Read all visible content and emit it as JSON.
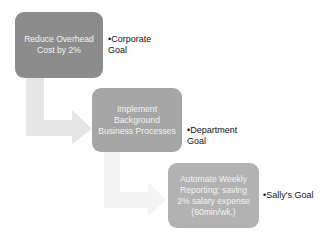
{
  "diagram": {
    "type": "hierarchy-process",
    "colors": {
      "box1": "#8c8c8c",
      "box2": "#a6a6a6",
      "box3": "#b2b2b2",
      "arrow": "#e6e6e6",
      "box_text": "#f2f2f2",
      "label_text": "#111111"
    },
    "steps": [
      {
        "label": "Reduce Overhead\nCost by 2%",
        "goal": "•Corporate\nGoal"
      },
      {
        "label": "Implement\nBackground\nBusiness Processes",
        "goal": "•Department\nGoal"
      },
      {
        "label": "Automate Weekly\nReporting; saving\n2% salary expense\n(60min/wk.)",
        "goal": "•Sally's Goal"
      }
    ]
  }
}
